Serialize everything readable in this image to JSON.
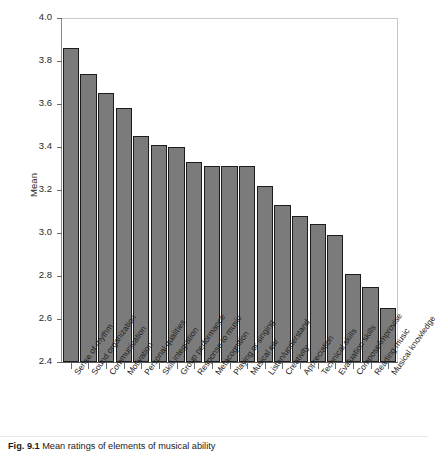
{
  "figure": {
    "caption_label": "Fig. 9.1",
    "caption_text": "Mean ratings of elements of musical ability"
  },
  "chart_data": {
    "type": "bar",
    "title": "",
    "xlabel": "",
    "ylabel": "Mean",
    "ylim": [
      2.4,
      4.0
    ],
    "ytick_labels": [
      "4.0",
      "3.8",
      "3.6",
      "3.4",
      "3.2",
      "3.0",
      "2.8",
      "2.6",
      "2.4"
    ],
    "yticks": [
      4.0,
      3.8,
      3.6,
      3.4,
      3.2,
      3.0,
      2.8,
      2.6,
      2.4
    ],
    "grid": false,
    "legend": "none",
    "bar_color": "#7b7b7b",
    "bar_edge_color": "#1c1c1c",
    "categories": [
      "Sense of rhythm",
      "Sound organization",
      "Communication",
      "Motivation",
      "Personal qualities",
      "Skill integration",
      "Group performance",
      "Response to music",
      "Metacognition",
      "Playing or singing",
      "Musical ear",
      "Listen/understand",
      "Creativity",
      "Appreciation",
      "Technical skills",
      "Evaluation skills",
      "Compose/improvise",
      "Reading music",
      "Musical knowledge"
    ],
    "values": [
      3.86,
      3.74,
      3.65,
      3.58,
      3.45,
      3.41,
      3.4,
      3.33,
      3.31,
      3.31,
      3.31,
      3.22,
      3.13,
      3.08,
      3.04,
      2.99,
      2.81,
      2.75,
      2.65
    ]
  }
}
